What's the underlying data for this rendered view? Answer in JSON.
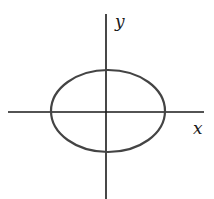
{
  "diagram": {
    "type": "ellipse-on-axes",
    "axes": {
      "x_label": "x",
      "y_label": "y",
      "color": "#1a1a1a"
    },
    "ellipse": {
      "stroke": "#444444",
      "center": "origin"
    }
  }
}
